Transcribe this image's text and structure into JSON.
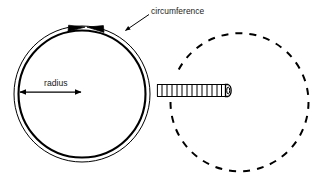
{
  "figure": {
    "background_color": "#ffffff",
    "stroke_color": "#000000",
    "text_color": "#1a1a1a",
    "width": 310,
    "height": 177
  },
  "labels": {
    "circumference": "circumference",
    "radius": "radius"
  },
  "solid_circle": {
    "name": "measured-circle",
    "center_x": 82,
    "center_y": 94,
    "outer_radius": 68,
    "inner_radius": 64,
    "outer_stroke_width": 1,
    "inner_stroke_width": 2.1,
    "style": "solid"
  },
  "dashed_circle": {
    "name": "unrolled-circle",
    "center_x": 236,
    "center_y": 97,
    "radius": 69,
    "stroke_width": 2,
    "dash_pattern": "7 7",
    "style": "dashed",
    "gap_description": "open on the left where the tape measure enters"
  },
  "circumference_arrows": {
    "name": "circumference-arc-arrows",
    "description": "two arrowheads meeting at the top of the circle pointing toward each other along the arc",
    "count": 2,
    "meet_x": 86,
    "meet_y": 27
  },
  "circumference_leader": {
    "from_x": 148,
    "from_y": 15,
    "to_x": 124,
    "to_y": 31,
    "arrowhead": "at-circle-end"
  },
  "radius_arrow": {
    "name": "radius-dimension-arrow",
    "from_x": 18,
    "from_y": 92,
    "to_x": 83,
    "to_y": 92,
    "double_headed": true
  },
  "tape_measure": {
    "name": "tape-measure",
    "left_x": 157,
    "right_x": 231,
    "top_y": 84,
    "bottom_y": 97,
    "tick_count": 14,
    "end_cap": "rounded",
    "orientation": "horizontal"
  }
}
